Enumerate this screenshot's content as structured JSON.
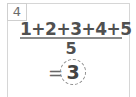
{
  "problem": {
    "number": "4",
    "numerator": "1+2+3+4+5",
    "denominator": "5",
    "equals": "=",
    "answer": "3"
  }
}
